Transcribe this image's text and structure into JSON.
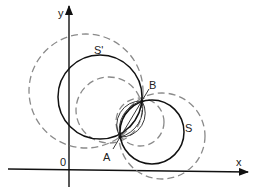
{
  "diagram": {
    "type": "geometry-circles-radical-axis",
    "axes": {
      "x_label": "x",
      "y_label": "y",
      "origin_label": "0"
    },
    "points": [
      {
        "label": "A",
        "x": 120,
        "y": 137
      },
      {
        "label": "B",
        "x": 142,
        "y": 101
      }
    ],
    "circles": [
      {
        "label": "S'",
        "style": "solid",
        "cx": 100,
        "cy": 97,
        "r": 42
      },
      {
        "label": "S",
        "style": "solid",
        "cx": 152,
        "cy": 132,
        "r": 32
      },
      {
        "label": "",
        "style": "dashed",
        "cx": 86,
        "cy": 91,
        "r": 57
      },
      {
        "label": "",
        "style": "dashed",
        "cx": 109,
        "cy": 110,
        "r": 33
      },
      {
        "label": "",
        "style": "dashed",
        "cx": 162,
        "cy": 136,
        "r": 43
      },
      {
        "label": "",
        "style": "dashed",
        "cx": 140,
        "cy": 122,
        "r": 24
      }
    ],
    "labels": {
      "s_prime": "S'",
      "s": "S",
      "a": "A",
      "b": "B"
    },
    "colors": {
      "solid": "#111111",
      "dashed": "#8a8a8a"
    }
  }
}
